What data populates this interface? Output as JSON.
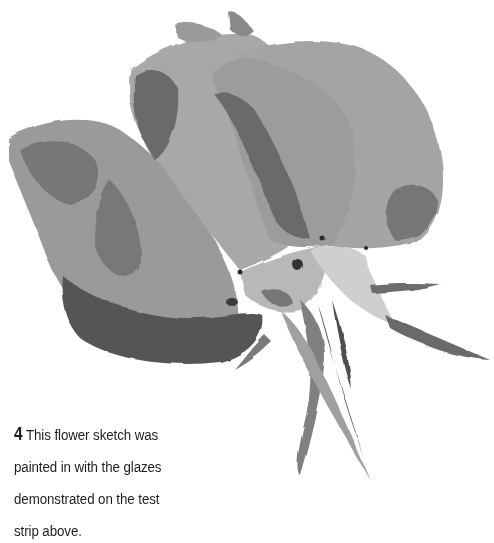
{
  "figure": {
    "number": "4",
    "illustration": "watercolor-rose-bud-sketch",
    "palette": {
      "background": "#ffffff",
      "light_wash": "#b4b4b4",
      "mid_wash": "#8e8e8e",
      "dark_glaze": "#5c5c5c",
      "deepest": "#3a3a3a",
      "text": "#1e1e1e"
    }
  },
  "caption": {
    "number": "4",
    "lines": [
      "This flower sketch was",
      "painted in with the glazes",
      "demonstrated on the test",
      "strip above."
    ]
  }
}
